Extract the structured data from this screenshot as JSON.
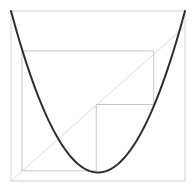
{
  "diagram": {
    "type": "cobweb-plot",
    "domain": [
      0,
      1
    ],
    "range": [
      0,
      1
    ],
    "curve": {
      "name": "quadratic-map",
      "form": "a + b*(x - c)^2",
      "a": 0.05,
      "b": 3.8,
      "c": 0.5,
      "color": "#2e2e2e"
    },
    "diagonal": {
      "from": [
        0,
        0
      ],
      "to": [
        0.99,
        0.9
      ],
      "color": "#dcdcdc"
    },
    "cobweb": {
      "color": "#c8c8c8",
      "points": [
        [
          0.063,
          0.06
        ],
        [
          0.063,
          0.765
        ],
        [
          0.82,
          0.765
        ],
        [
          0.82,
          0.45
        ],
        [
          0.49,
          0.45
        ],
        [
          0.49,
          0.06
        ],
        [
          0.063,
          0.06
        ]
      ]
    },
    "frame_color": "#d2d2d2"
  }
}
